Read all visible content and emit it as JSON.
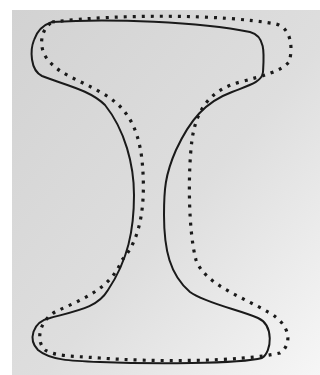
{
  "figure": {
    "background": {
      "color": "#d6d6d6",
      "fade_to": "#f4f4f4"
    },
    "outlines": [
      {
        "name": "solid-outline",
        "style": "solid",
        "color": "#1a1a1a"
      },
      {
        "name": "dotted-outline",
        "style": "dotted",
        "color": "#1a1a1a"
      }
    ]
  }
}
